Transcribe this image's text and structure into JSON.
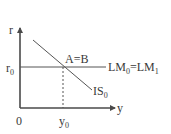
{
  "diagram": {
    "type": "IS-LM",
    "axes": {
      "y_axis_label": "r",
      "x_axis_label": "y",
      "origin_label": "0"
    },
    "levels": {
      "r_level_label": "r",
      "r_level_sub": "0",
      "y_level_label": "y",
      "y_level_sub": "0"
    },
    "curves": {
      "lm_label_main": "LM",
      "lm_label_sub1": "0",
      "lm_label_eq": "=LM",
      "lm_label_sub2": "1",
      "is_label_main": "IS",
      "is_label_sub": "0"
    },
    "intersection_label": "A=B",
    "colors": {
      "axis": "#4a4a4a",
      "line": "#555555",
      "text": "#3a3a3a"
    }
  }
}
